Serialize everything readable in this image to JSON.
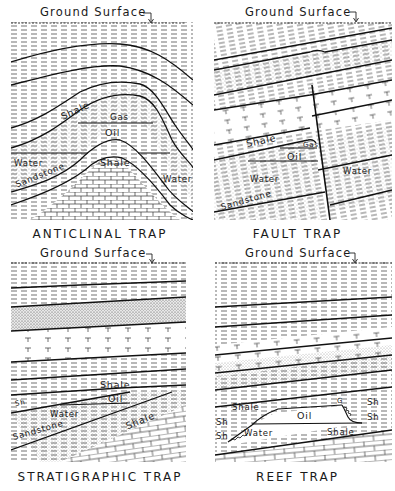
{
  "figure": {
    "panels": [
      {
        "id": "anticlinal",
        "title": "ANTICLINAL TRAP",
        "surface_label": "Ground Surface",
        "labels": {
          "shale_top": "Shale",
          "gas": "Gas",
          "oil": "Oil",
          "water_left": "Water",
          "sandstone": "Sandstone",
          "shale_core": "Shale",
          "water_right": "Water"
        }
      },
      {
        "id": "fault",
        "title": "FAULT TRAP",
        "surface_label": "Ground Surface",
        "labels": {
          "shale": "Shale",
          "gas": "Gas",
          "oil": "Oil",
          "water_left": "Water",
          "water_right": "Water",
          "sandstone": "Sandstone"
        }
      },
      {
        "id": "stratigraphic",
        "title": "STRATIGRAPHIC TRAP",
        "surface_label": "Ground Surface",
        "labels": {
          "shale_top": "Shale",
          "sh": "Sh",
          "oil": "Oil",
          "water": "Water",
          "sandstone": "Sandstone",
          "shale_bottom": "Shale"
        }
      },
      {
        "id": "reef",
        "title": "REEF TRAP",
        "surface_label": "Ground Surface",
        "labels": {
          "shale_left": "Shale",
          "sh_left_1": "Sh",
          "sh_left_2": "Sh",
          "water": "Water",
          "oil": "Oil",
          "gas_g": "G",
          "sh_right_1": "Sh",
          "sh_right_2": "Sh",
          "shale_bottom": "Shale"
        }
      }
    ],
    "surface_arrow_icon": "down-arrow"
  }
}
